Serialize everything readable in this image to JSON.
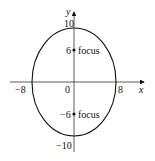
{
  "diagram": {
    "type": "ellipse-with-foci",
    "x_axis_label": "x",
    "y_axis_label": "y",
    "origin_label": "0",
    "vertex_labels": {
      "left": "−8",
      "right": "8",
      "top": "10",
      "bottom": "−10"
    },
    "foci": [
      {
        "value_label": "6",
        "text": "focus",
        "y": 6
      },
      {
        "value_label": "−6",
        "text": "focus",
        "y": -6
      }
    ],
    "semi_axes": {
      "a": 8,
      "b": 10
    },
    "colors": {
      "stroke": "#111111",
      "background": "#ffffff"
    }
  }
}
